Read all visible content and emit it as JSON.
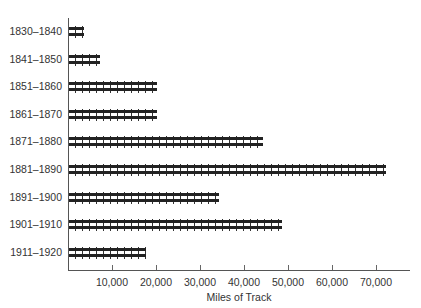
{
  "chart_data": {
    "type": "bar",
    "orientation": "horizontal",
    "title": "",
    "xlabel": "Miles of Track",
    "ylabel": "",
    "categories": [
      "1830–1840",
      "1841–1850",
      "1851–1860",
      "1861–1870",
      "1871–1880",
      "1881–1890",
      "1891–1900",
      "1901–1910",
      "1911–1920"
    ],
    "values": [
      3300,
      7000,
      20000,
      20000,
      44000,
      72000,
      34000,
      48500,
      17500
    ],
    "xlim": [
      0,
      78000
    ],
    "xticks": [
      10000,
      20000,
      30000,
      40000,
      50000,
      60000,
      70000
    ],
    "xtick_labels": [
      "10,000",
      "20,000",
      "30,000",
      "40,000",
      "50,000",
      "60,000",
      "70,000"
    ],
    "grid": false,
    "legend": null,
    "bar_style": "railroad-track"
  },
  "colors": {
    "bar": "#222222",
    "axis": "#555555",
    "text": "#333333"
  }
}
